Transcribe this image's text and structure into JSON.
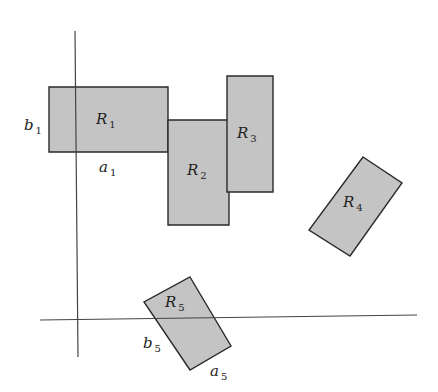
{
  "diagram": {
    "type": "rectangles-in-plane",
    "axes": {
      "vertical": {
        "x1": 75,
        "y1": 31,
        "x2": 78,
        "y2": 357
      },
      "horizontal": {
        "x1": 40,
        "y1": 320,
        "x2": 417,
        "y2": 315
      }
    },
    "rectangles": [
      {
        "id": "R1",
        "label": "R",
        "sub": "1",
        "points": "49,87 168,87 168,152 49,152",
        "label_pos": [
          96,
          124
        ]
      },
      {
        "id": "R2",
        "label": "R",
        "sub": "2",
        "points": "168,120 229,120 229,225 168,225",
        "label_pos": [
          187,
          175
        ]
      },
      {
        "id": "R3",
        "label": "R",
        "sub": "3",
        "points": "227,76 273,76 273,192 227,192",
        "label_pos": [
          237,
          138
        ]
      },
      {
        "id": "R4",
        "label": "R",
        "sub": "4",
        "points": "363,157 402,183 350,256 309,230",
        "label_pos": [
          343,
          207
        ]
      },
      {
        "id": "R5",
        "label": "R",
        "sub": "5",
        "points": "190,277 231,346 190,370 144,302",
        "label_pos": [
          165,
          307
        ]
      }
    ],
    "dimension_labels": [
      {
        "id": "b1",
        "label": "b",
        "sub": "1",
        "pos": [
          24,
          130
        ]
      },
      {
        "id": "a1",
        "label": "a",
        "sub": "1",
        "pos": [
          99,
          172
        ]
      },
      {
        "id": "b5",
        "label": "b",
        "sub": "5",
        "pos": [
          143,
          348
        ]
      },
      {
        "id": "a5",
        "label": "a",
        "sub": "5",
        "pos": [
          210,
          376
        ]
      }
    ]
  }
}
